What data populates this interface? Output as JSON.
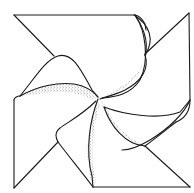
{
  "figure": {
    "subject": "pinwheel line drawing",
    "colors": {
      "background": "#ffffff",
      "ink": "#1a1a1a",
      "stipple": "#333333"
    },
    "blades": [
      {
        "id": "top-left",
        "corner": [
          14,
          15
        ]
      },
      {
        "id": "top-right",
        "corner": [
          189,
          13
        ]
      },
      {
        "id": "bottom-right",
        "corner": [
          190,
          187
        ]
      },
      {
        "id": "bottom-left",
        "corner": [
          14,
          188
        ]
      }
    ],
    "center": [
      98,
      98
    ]
  }
}
